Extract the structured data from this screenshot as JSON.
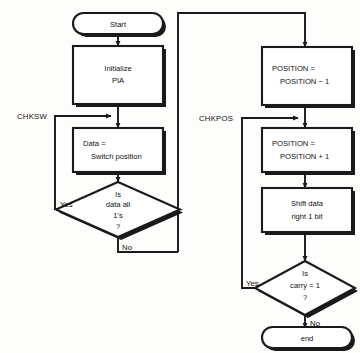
{
  "diagram": {
    "background_color": "#fdfdfb",
    "line_color": "#1a1a1a",
    "shape_fill": "#ffffff"
  },
  "nodes": {
    "start": {
      "type": "terminator",
      "label": "Start"
    },
    "initialize_pia": {
      "type": "process",
      "line1": "Initialize",
      "line2": "PIA"
    },
    "read_switch": {
      "type": "process",
      "line1": "Data =",
      "line2": "Switch position"
    },
    "check_all_ones": {
      "type": "decision",
      "line1": "Is",
      "line2": "data all",
      "line3": "1's",
      "line4": "?"
    },
    "position_minus": {
      "type": "process",
      "line1": "POSITION =",
      "line2": "POSITION − 1"
    },
    "position_plus": {
      "type": "process",
      "line1": "POSITION =",
      "line2": "POSITION + 1"
    },
    "shift_data": {
      "type": "process",
      "line1": "Shift data",
      "line2": "right 1 bit"
    },
    "check_carry": {
      "type": "decision",
      "line1": "Is",
      "line2": "carry = 1",
      "line3": "?"
    },
    "end": {
      "type": "terminator",
      "label": "end"
    }
  },
  "labels": {
    "chksw": "CHKSW",
    "chkpos": "CHKPOS",
    "yes_switch": "Yes",
    "no_switch": "No",
    "yes_carry": "Yes",
    "no_carry": "No"
  }
}
